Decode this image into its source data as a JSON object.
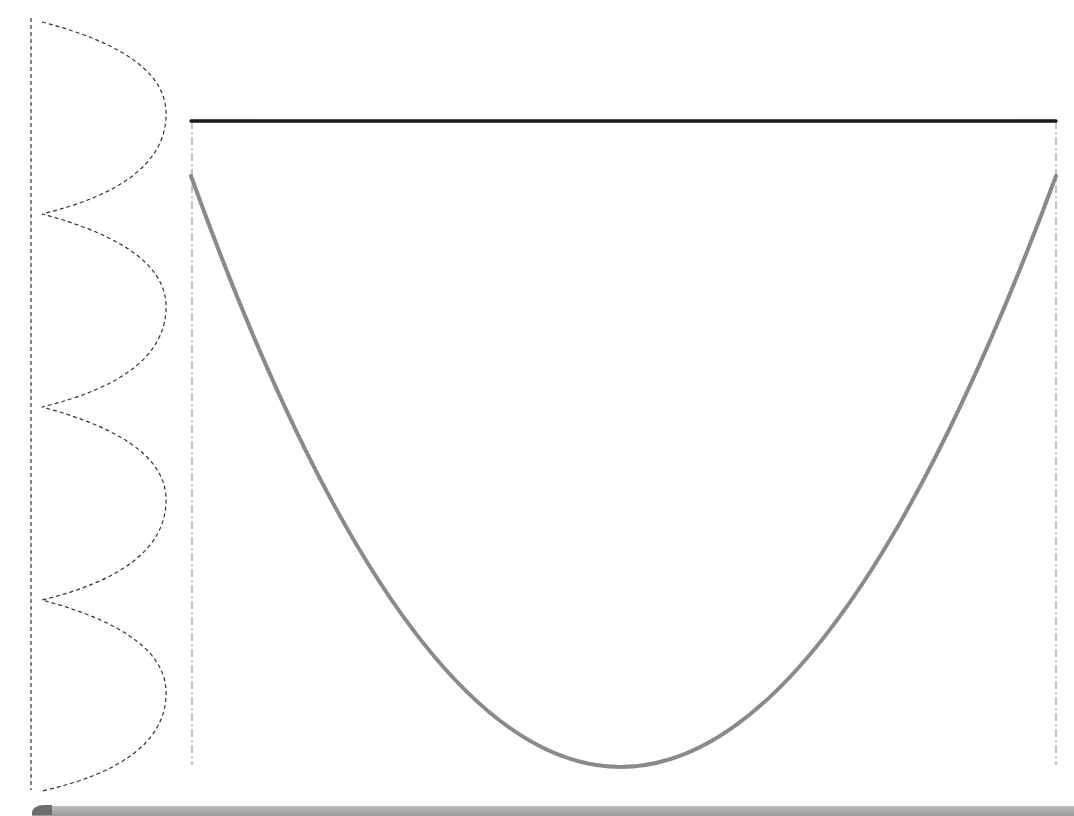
{
  "diagram": {
    "colors": {
      "background": "#ffffff",
      "top_bar": "#1a1a1a",
      "parabola": "#8a8a8a",
      "guide_lines": "#9a9a9a",
      "wave": "#333333",
      "left_axis": "#333333",
      "bottom_bar": "#a8a8a8"
    },
    "top_bar": {
      "x1": 191,
      "x2": 1056,
      "y": 121
    },
    "parabola": {
      "left": [
        191,
        176
      ],
      "right": [
        1056,
        176
      ],
      "vertex": [
        618,
        767
      ]
    },
    "guide_lines": [
      {
        "x": 192,
        "y1": 121,
        "y2": 765
      },
      {
        "x": 1056,
        "y1": 121,
        "y2": 765
      }
    ],
    "left_axis": {
      "x": 31,
      "y1": 18,
      "y2": 790
    },
    "wave": {
      "cusp_x": 42,
      "peak_x": 166,
      "cusps_y": [
        22,
        214,
        407,
        600,
        791
      ]
    }
  }
}
